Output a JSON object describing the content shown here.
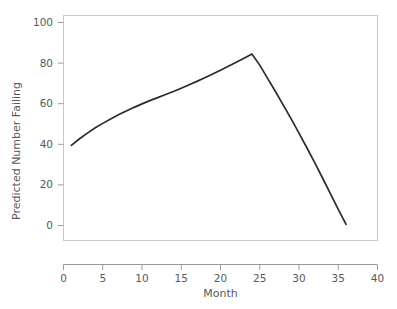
{
  "chart_data": {
    "type": "line",
    "title": "",
    "xlabel": "Month",
    "ylabel": "Predicted Number Failing",
    "xlim": [
      0,
      40
    ],
    "ylim": [
      0,
      105
    ],
    "xticks": [
      0,
      5,
      10,
      15,
      20,
      25,
      30,
      35,
      40
    ],
    "xtick_labels": [
      "0",
      "5",
      "10",
      "15",
      "20",
      "25",
      "30",
      "35",
      "40"
    ],
    "yticks": [
      0,
      20,
      40,
      60,
      80,
      100
    ],
    "ytick_labels": [
      "0",
      "20",
      "40",
      "60",
      "80",
      "100"
    ],
    "grid": false,
    "legend": false,
    "line_color": "#2b2b2b",
    "frame_color": "#c9c9c9",
    "background": "#ffffff",
    "series": [
      {
        "name": "Predicted Number Failing",
        "x": [
          1,
          2,
          3,
          4,
          5,
          6,
          7,
          8,
          9,
          10,
          11,
          12,
          13,
          14,
          15,
          16,
          17,
          18,
          19,
          20,
          21,
          22,
          23,
          24,
          25,
          26,
          27,
          28,
          29,
          30,
          31,
          32,
          33,
          34,
          35,
          36
        ],
        "values": [
          39.5,
          42.6,
          45.4,
          48.0,
          50.3,
          52.5,
          54.5,
          56.4,
          58.2,
          59.9,
          61.5,
          63.0,
          64.5,
          66.0,
          67.6,
          69.3,
          71.0,
          72.8,
          74.6,
          76.5,
          78.4,
          80.4,
          82.4,
          84.5,
          79.0,
          72.5,
          66.0,
          59.3,
          52.5,
          45.5,
          38.3,
          31.0,
          23.4,
          15.7,
          8.0,
          0.6
        ]
      }
    ],
    "annotations": {
      "peak_month": 24,
      "peak_value": 84.5,
      "start_month": 1,
      "start_value": 39.5,
      "end_month": 36,
      "end_value": 0.6
    }
  },
  "axes": {
    "y_axis_title": "Predicted Number Failing",
    "x_axis_title": "Month"
  }
}
